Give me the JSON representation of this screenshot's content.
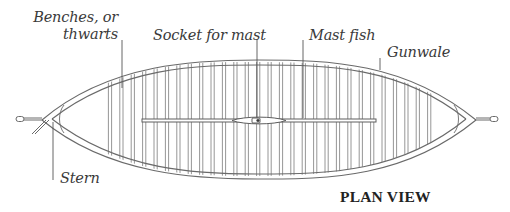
{
  "diagram": {
    "title": "PLAN VIEW",
    "labels": {
      "benches": [
        "Benches, or",
        "thwarts"
      ],
      "socket": "Socket for mast",
      "mast_fish": "Mast fish",
      "gunwale": "Gunwale",
      "stern": "Stern"
    },
    "colors": {
      "line": "#6e6e6e",
      "leader": "#555555",
      "text": "#3a3a3a",
      "background": "#ffffff"
    }
  }
}
